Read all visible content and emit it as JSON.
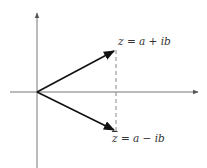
{
  "diagram": {
    "type": "complex-plane-conjugate",
    "axes": {
      "origin": [
        37,
        92
      ],
      "x_axis": {
        "from": [
          10,
          92
        ],
        "to": [
          199,
          92
        ],
        "arrow": true
      },
      "y_axis": {
        "from": [
          37,
          168
        ],
        "to": [
          37,
          12
        ],
        "arrow": true
      },
      "color": "#777777"
    },
    "vectors": [
      {
        "name": "z",
        "from": [
          37,
          92
        ],
        "to": [
          115,
          50
        ],
        "color": "#111111"
      },
      {
        "name": "z-conjugate",
        "from": [
          37,
          92
        ],
        "to": [
          115,
          131
        ],
        "color": "#111111"
      }
    ],
    "dashed_line": {
      "from": [
        116,
        50
      ],
      "to": [
        116,
        132
      ],
      "color": "#888888"
    },
    "labels": {
      "z": {
        "symbol": "z",
        "rest": " = a + ib"
      },
      "z_conj": {
        "symbol": "z",
        "rest": " = a − ib"
      }
    }
  }
}
